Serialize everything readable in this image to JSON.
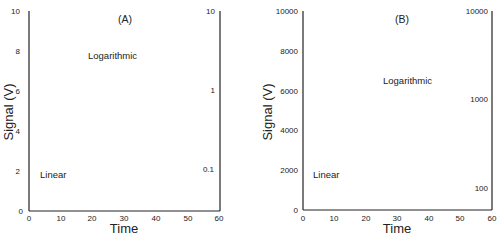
{
  "chart_data": [
    {
      "type": "line",
      "title": "(A)",
      "xlabel": "Time",
      "ylabel": "Signal (V)",
      "xlim": [
        0,
        60
      ],
      "xticks": [
        0,
        10,
        20,
        30,
        40,
        50,
        60
      ],
      "ylim_left": [
        0,
        10
      ],
      "yticks_left": [
        0,
        2,
        4,
        6,
        8,
        10
      ],
      "right_axis": {
        "scale": "log",
        "ticks": [
          "10",
          "1",
          "0.1"
        ],
        "range": [
          0.03,
          10
        ]
      },
      "series": [
        {
          "name": "Linear",
          "axis": "left",
          "model": "exponential decay",
          "t": [
            0,
            5,
            10,
            15,
            20,
            25,
            30,
            35,
            40,
            45,
            50
          ],
          "values": [
            10,
            5.9,
            3.5,
            2.2,
            1.4,
            0.9,
            0.55,
            0.4,
            0.2,
            0.1,
            0.05
          ]
        },
        {
          "name": "Logarithmic",
          "axis": "right-log",
          "model": "straight line on log axis with noise",
          "t": [
            0,
            10,
            20,
            30,
            40,
            50
          ],
          "values": [
            10,
            3.7,
            1.35,
            0.5,
            0.18,
            0.066
          ]
        }
      ],
      "annotations": [
        "Logarithmic",
        "Linear"
      ]
    },
    {
      "type": "line",
      "title": "(B)",
      "xlabel": "Time",
      "ylabel": "Signal (V)",
      "xlim": [
        0,
        60
      ],
      "xticks": [
        0,
        10,
        20,
        30,
        40,
        50,
        60
      ],
      "ylim_left": [
        0,
        10000
      ],
      "yticks_left": [
        0,
        2000,
        4000,
        6000,
        8000,
        10000
      ],
      "right_axis": {
        "scale": "log",
        "ticks": [
          "10000",
          "1000",
          "100"
        ],
        "range": [
          56,
          10000
        ]
      },
      "series": [
        {
          "name": "Linear",
          "axis": "left",
          "model": "exponential decay",
          "t": [
            0,
            5,
            10,
            15,
            20,
            25,
            30,
            35,
            40,
            45,
            50
          ],
          "values": [
            10000,
            6200,
            3870,
            2400,
            1500,
            930,
            580,
            360,
            220,
            140,
            90
          ]
        },
        {
          "name": "Logarithmic",
          "axis": "right-log",
          "model": "straight line on log axis with slight noise",
          "t": [
            0,
            10,
            20,
            30,
            40,
            50
          ],
          "values": [
            10000,
            3630,
            1320,
            480,
            174,
            63
          ]
        }
      ],
      "annotations": [
        "Logarithmic",
        "Linear"
      ]
    }
  ],
  "panels": [
    {
      "title": "(A)",
      "xlabel": "Time",
      "ylabel": "Signal  (V)",
      "log_label": "Logarithmic",
      "lin_label": "Linear",
      "xticks": [
        "0",
        "10",
        "20",
        "30",
        "40",
        "50",
        "60"
      ],
      "yticks": [
        "0",
        "2",
        "4",
        "6",
        "8",
        "10"
      ],
      "rticks": [
        "10",
        "1",
        "0.1"
      ]
    },
    {
      "title": "(B)",
      "xlabel": "Time",
      "ylabel": "Signal  (V)",
      "log_label": "Logarithmic",
      "lin_label": "Linear",
      "xticks": [
        "0",
        "10",
        "20",
        "30",
        "40",
        "50",
        "60"
      ],
      "yticks": [
        "0",
        "2000",
        "4000",
        "6000",
        "8000",
        "10000"
      ],
      "rticks": [
        "10000",
        "1000",
        "100"
      ]
    }
  ]
}
